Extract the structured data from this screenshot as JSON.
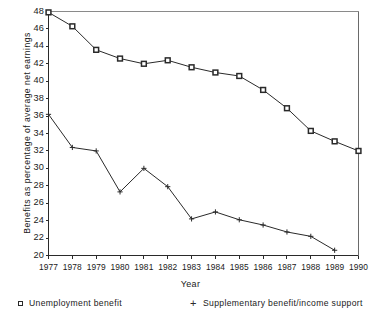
{
  "chart_data": {
    "type": "line",
    "title": "",
    "xlabel": "Year",
    "ylabel": "Benefits as percentage of average net earnings",
    "x": [
      1977,
      1978,
      1979,
      1980,
      1981,
      1982,
      1983,
      1984,
      1985,
      1986,
      1987,
      1988,
      1989,
      1990
    ],
    "xtick_labels": [
      "1977",
      "1978",
      "1979",
      "1980",
      "1981",
      "1982",
      "1983",
      "1984",
      "1985",
      "1986",
      "1987",
      "1988",
      "1989",
      "1990"
    ],
    "ytick_labels": [
      "20",
      "22",
      "24",
      "26",
      "28",
      "30",
      "32",
      "34",
      "36",
      "38",
      "40",
      "42",
      "44",
      "46",
      "48"
    ],
    "ytick_values": [
      20,
      22,
      24,
      26,
      28,
      30,
      32,
      34,
      36,
      38,
      40,
      42,
      44,
      46,
      48
    ],
    "xlim": [
      1977,
      1990
    ],
    "ylim": [
      20,
      48
    ],
    "grid": false,
    "legend_position": "below-axes",
    "series": [
      {
        "name": "Unemployment benefit",
        "marker": "square",
        "color": "#2a2a2a",
        "values": [
          47.9,
          46.3,
          43.6,
          42.6,
          42.0,
          42.4,
          41.6,
          41.0,
          40.6,
          39.0,
          36.9,
          34.3,
          33.1,
          32.0
        ]
      },
      {
        "name": "Supplementary benefit/income support",
        "marker": "plus",
        "color": "#2a2a2a",
        "values": [
          36.2,
          32.4,
          32.0,
          27.3,
          30.0,
          27.9,
          24.2,
          25.0,
          24.1,
          23.5,
          22.7,
          22.2,
          20.6,
          null
        ]
      }
    ]
  },
  "legend": {
    "items": [
      {
        "label": "Unemployment benefit",
        "marker": "square-marker-icon"
      },
      {
        "label": "Supplementary benefit/income support",
        "marker": "plus-marker-icon"
      }
    ]
  },
  "axes": {
    "x_title": "Year",
    "y_title": "Benefits as percentage of average net earnings"
  }
}
